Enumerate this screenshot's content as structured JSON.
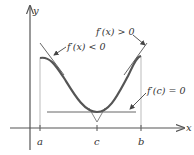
{
  "figure": {
    "axes": {
      "x_label": "x",
      "y_label": "y"
    },
    "ticks": [
      {
        "label": "a"
      },
      {
        "label": "c"
      },
      {
        "label": "b"
      }
    ],
    "annotations": {
      "decreasing": "f′(x) < 0",
      "increasing": "f′(x) > 0",
      "critical": "f′(c) = 0"
    },
    "colors": {
      "axis": "#555555",
      "curve": "#555555",
      "tangent": "#666666",
      "guide": "#bbbbbb",
      "text": "#333333"
    }
  }
}
